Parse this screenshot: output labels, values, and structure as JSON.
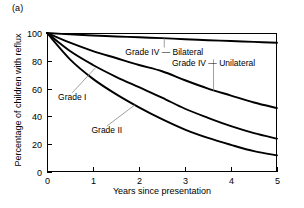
{
  "figure": {
    "panel_label": "(a)",
    "background": "#ffffff",
    "line_color": "#000000",
    "leader_color": "#888888"
  },
  "chart_data": {
    "type": "line",
    "title": "",
    "subtitle": "",
    "xlabel": "Years since presentation",
    "ylabel": "Percentage of children with reflux",
    "xlim": [
      0,
      5
    ],
    "ylim": [
      0,
      100
    ],
    "xticks": [
      "0",
      "1",
      "2",
      "3",
      "4",
      "5"
    ],
    "yticks": [
      "0",
      "20",
      "40",
      "60",
      "80",
      "100"
    ],
    "grid": false,
    "legend_position": "inline-annotations",
    "x": [
      0,
      0.5,
      1,
      1.5,
      2,
      2.5,
      3,
      3.5,
      4,
      4.5,
      5
    ],
    "series": [
      {
        "name": "Grade IV — Bilateral",
        "label": "Grade IV — Bilateral",
        "values": [
          100,
          99,
          98.2,
          97.5,
          96.9,
          96.3,
          95.5,
          94.8,
          94.2,
          93.6,
          93
        ]
      },
      {
        "name": "Grade IV — Unilateral",
        "label": "Grade IV — Unilateral",
        "values": [
          100,
          93,
          87,
          82,
          77,
          72.5,
          66,
          60,
          55,
          50,
          46
        ]
      },
      {
        "name": "Grade I",
        "label": "Grade I",
        "values": [
          100,
          87,
          77,
          68.5,
          61,
          53.5,
          45.5,
          39,
          33,
          28,
          24
        ]
      },
      {
        "name": "Grade II",
        "label": "Grade II",
        "values": [
          100,
          81,
          67,
          56,
          46.5,
          38,
          30.5,
          24.5,
          19.5,
          15,
          12
        ]
      }
    ],
    "annotations": [
      {
        "text": "Grade IV — Bilateral",
        "anchor_x": 2.55,
        "anchor_y": 96.2,
        "label_x": 2.55,
        "label_y": 84.5
      },
      {
        "text": "Grade IV — Unilateral",
        "anchor_x": 3.62,
        "anchor_y": 58.6,
        "label_x": 3.62,
        "label_y": 76.0
      },
      {
        "text": "Grade I",
        "anchor_x": 1.06,
        "anchor_y": 75.2,
        "label_x": 0.55,
        "label_y": 52.0
      },
      {
        "text": "Grade II",
        "anchor_x": 1.92,
        "anchor_y": 48.5,
        "label_x": 1.3,
        "label_y": 28.0
      }
    ]
  }
}
